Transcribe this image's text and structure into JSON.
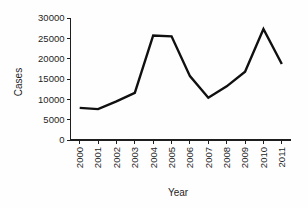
{
  "chart_data": {
    "type": "line",
    "title": "",
    "xlabel": "Year",
    "ylabel": "Cases",
    "categories": [
      "2000",
      "2001",
      "2002",
      "2003",
      "2004",
      "2005",
      "2006",
      "2007",
      "2008",
      "2009",
      "2010",
      "2011"
    ],
    "values": [
      7900,
      7600,
      9500,
      11600,
      25700,
      25500,
      15700,
      10400,
      13200,
      16800,
      27300,
      18700
    ],
    "series": [
      {
        "name": "Cases",
        "values": [
          7900,
          7600,
          9500,
          11600,
          25700,
          25500,
          15700,
          10400,
          13200,
          16800,
          27300,
          18700
        ]
      }
    ],
    "ylim": [
      0,
      30000
    ],
    "ytick_labels": [
      "0",
      "5000",
      "10000",
      "15000",
      "20000",
      "25000",
      "30000"
    ],
    "ytick_values": [
      0,
      5000,
      10000,
      15000,
      20000,
      25000,
      30000
    ],
    "xtick_labels": [
      "2000",
      "2001",
      "2002",
      "2003",
      "2004",
      "2005",
      "2006",
      "2007",
      "2008",
      "2009",
      "2010",
      "2011"
    ],
    "xtick_rotation": 90,
    "grid": false,
    "legend": false,
    "legend_position": "none",
    "line_color": "#101010",
    "axis_color": "#1e1e1e",
    "background_color": "#fefefe"
  }
}
